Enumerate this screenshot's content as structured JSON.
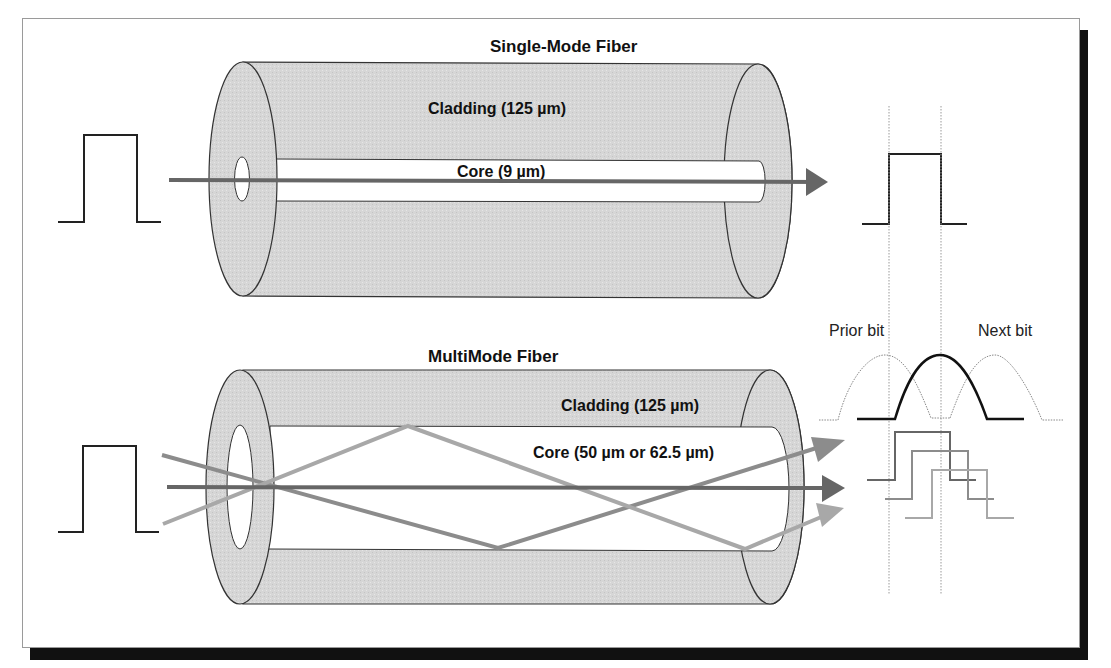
{
  "single_mode": {
    "title": "Single-Mode Fiber",
    "cladding_label": "Cladding (125 µm)",
    "core_label": "Core (9 µm)"
  },
  "multi_mode": {
    "title": "MultiMode Fiber",
    "cladding_label": "Cladding (125 µm)",
    "core_label": "Core (50 µm or 62.5 µm)"
  },
  "bit_labels": {
    "prior": "Prior bit",
    "next": "Next bit"
  },
  "colors": {
    "cladding_fill": "#d9d9d9",
    "outline": "#333333",
    "ray_dark": "#666666",
    "ray_mid": "#8c8c8c",
    "ray_light": "#a8a8a8",
    "pulse": "#222222",
    "shadow": "#111111"
  }
}
